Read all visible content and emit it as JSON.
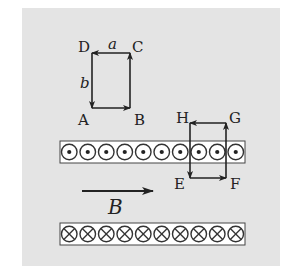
{
  "diagram": {
    "title": "",
    "background_color": "#e4e4e4",
    "line_color": "#222222",
    "loop_abcd": {
      "vertices": {
        "A": {
          "label": "A",
          "x": 92,
          "y": 108
        },
        "B": {
          "label": "B",
          "x": 130,
          "y": 108
        },
        "C": {
          "label": "C",
          "x": 130,
          "y": 53
        },
        "D": {
          "label": "D",
          "x": 92,
          "y": 53
        }
      },
      "side_labels": {
        "top": "a",
        "left": "b"
      },
      "current_direction": "A→B→C→D→A"
    },
    "loop_efgh": {
      "vertices": {
        "E": {
          "label": "E",
          "x": 190,
          "y": 178
        },
        "F": {
          "label": "F",
          "x": 226,
          "y": 178
        },
        "G": {
          "label": "G",
          "x": 226,
          "y": 123
        },
        "H": {
          "label": "H",
          "x": 190,
          "y": 123
        }
      },
      "current_direction": "E→F→G→H→E"
    },
    "wire_sheet_top": {
      "symbol": "dot",
      "meaning": "current out of page",
      "count": 10,
      "box": {
        "x": 60,
        "y": 141,
        "w": 185,
        "h": 22
      }
    },
    "wire_sheet_bottom": {
      "symbol": "cross",
      "meaning": "current into page",
      "count": 10,
      "box": {
        "x": 60,
        "y": 223,
        "w": 185,
        "h": 22
      }
    },
    "field": {
      "label": "B",
      "arrow": {
        "x1": 82,
        "y1": 191,
        "x2": 153,
        "y2": 191
      },
      "direction": "right"
    }
  }
}
